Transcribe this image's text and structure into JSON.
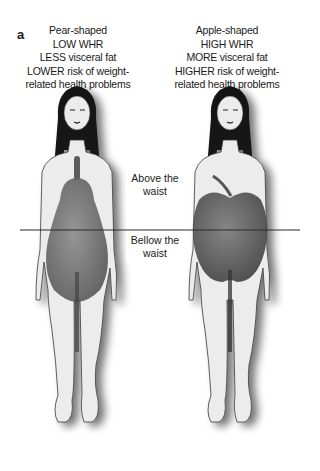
{
  "panel_label": "a",
  "figures": [
    {
      "id": "pear",
      "caption_lines": [
        "Pear-shaped",
        "LOW WHR",
        "LESS visceral fat",
        "LOWER risk of weight-",
        "related health problems"
      ],
      "fruit": "pear"
    },
    {
      "id": "apple",
      "caption_lines": [
        "Apple-shaped",
        "HIGH WHR",
        "MORE visceral fat",
        "HIGHER risk of weight-",
        "related health problems"
      ],
      "fruit": "apple"
    }
  ],
  "waist_labels": {
    "above": [
      "Above the",
      "waist"
    ],
    "below": [
      "Bellow the",
      "waist"
    ]
  },
  "colors": {
    "skin": "#ececec",
    "outline": "#3a3a3a",
    "hair": "#141414",
    "fruit": "#6e6e6e",
    "waist_line": "#2a2a2a"
  }
}
